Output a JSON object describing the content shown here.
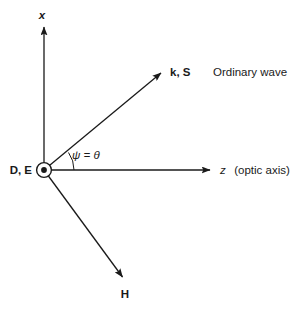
{
  "figure": {
    "kind": "vector-diagram",
    "caption": "Ordinary wave",
    "background_color": "#ffffff",
    "ink_color": "#1a1a1a",
    "width": 296,
    "height": 312
  },
  "origin": {
    "label": "D, E",
    "marker": "dot-in-circle-out-of-page",
    "x": 44,
    "y": 170
  },
  "axes": {
    "vertical": {
      "name": "x-axis",
      "label": "x",
      "tip_x": 44,
      "tip_y": 25,
      "label_x": 42,
      "label_y": 19
    },
    "horizontal": {
      "name": "z-axis",
      "label_symbol": "z",
      "label_note": "(optic axis)",
      "tip_x": 212,
      "tip_y": 170,
      "label_x": 220,
      "label_y": 174
    }
  },
  "vectors": [
    {
      "id": "k-S",
      "label": "k, S",
      "tip_x": 163,
      "tip_y": 71,
      "label_x": 170,
      "label_y": 76
    },
    {
      "id": "H",
      "label": "H",
      "tip_x": 124,
      "tip_y": 280,
      "label_x": 125,
      "label_y": 298
    }
  ],
  "angle": {
    "label": "ψ = θ",
    "arc_radius": 30,
    "label_x": 72,
    "label_y": 159
  },
  "caption": {
    "text": "Ordinary wave",
    "x": 213,
    "y": 76
  }
}
